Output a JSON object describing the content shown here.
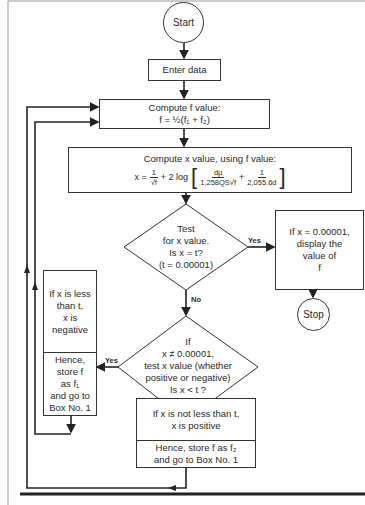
{
  "nodes": {
    "start": {
      "label": "Start"
    },
    "enter_data": {
      "label": "Enter data"
    },
    "compute_f": {
      "title": "Compute f value:",
      "formula": "f = ½(f₁ + f₂)"
    },
    "compute_x": {
      "title": "Compute x value, using f value:",
      "lhs": "x =",
      "frac1_num": "1",
      "frac1_den": "√f",
      "mid": "+ 2 log",
      "frac2_num": "dμ",
      "frac2_den": "1,258QS√f",
      "plus": "+",
      "frac3_num": "1",
      "frac3_den": "2,055.6d"
    },
    "test_x": {
      "lines": [
        "Test",
        "for x value.",
        "Is x = t?",
        "(t = 0.00001)"
      ]
    },
    "display_f": {
      "lines": [
        "If x = 0.00001,",
        "display the",
        "value of",
        "f"
      ]
    },
    "stop": {
      "label": "Stop"
    },
    "test_sign": {
      "lines": [
        "If",
        "x ≠ 0.00001,",
        "test x value (whether",
        "positive or negative)",
        "Is x < t ?"
      ]
    },
    "negative_box": {
      "top": [
        "If x is less",
        "than t,",
        "x is",
        "negative"
      ],
      "bottom": [
        "Hence,",
        "store f",
        "as f₁",
        "and go to",
        "Box No. 1"
      ]
    },
    "positive_box": {
      "top": [
        "If x is not less than t,",
        "x is positive"
      ],
      "bottom": [
        "Hence, store f as f₂",
        "and go to Box No. 1"
      ]
    }
  },
  "edge_labels": {
    "test_x_yes": "Yes",
    "test_x_no": "No",
    "test_sign_yes": "Yes",
    "test_sign_no": "No"
  }
}
